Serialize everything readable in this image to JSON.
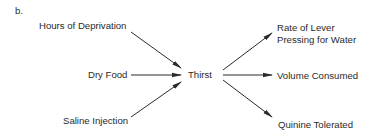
{
  "panel_label": "b.",
  "center": {
    "label": "Thirst"
  },
  "inputs": [
    {
      "label": "Hours of Deprivation"
    },
    {
      "label": "Dry Food"
    },
    {
      "label": "Saline Injection"
    }
  ],
  "outputs": [
    {
      "label_line1": "Rate of Lever",
      "label_line2": "Pressing for Water"
    },
    {
      "label": "Volume Consumed"
    },
    {
      "label": "Quinine Tolerated"
    }
  ],
  "colors": {
    "line": "#2a2a2a",
    "text": "#2a2a2a",
    "background": "#ffffff"
  }
}
